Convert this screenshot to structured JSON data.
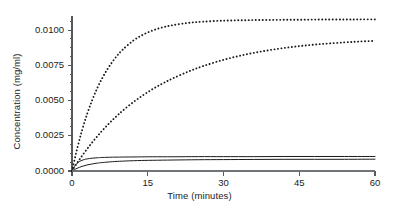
{
  "chart_data": {
    "type": "line",
    "title": "",
    "xlabel": "Time (minutes)",
    "ylabel": "Concentration (mg/ml)",
    "xlim": [
      0,
      60
    ],
    "ylim": [
      0,
      0.011
    ],
    "xticks": [
      0,
      15,
      30,
      45,
      60
    ],
    "xtick_labels": [
      "0",
      "15",
      "30",
      "45",
      "60"
    ],
    "yticks": [
      0.0,
      0.0025,
      0.005,
      0.0075,
      0.01
    ],
    "ytick_labels": [
      "0.0000",
      "0.0025",
      "0.0050",
      "0.0075",
      "0.0100"
    ],
    "y_minor_ticks": [
      0.000625,
      0.00125,
      0.001875,
      0.003125,
      0.00375,
      0.004375,
      0.005625,
      0.00625,
      0.006875,
      0.008125,
      0.00875,
      0.009375,
      0.010625
    ],
    "grid": false,
    "legend": "none",
    "axes_color": "#55585c",
    "curve_color": "#1b1b1b",
    "series": [
      {
        "name": "dotted-fast",
        "style": "dotted",
        "color": "#1b1b1b",
        "x": [
          0,
          1,
          2,
          3,
          4,
          5,
          6,
          7,
          8,
          9,
          10,
          12,
          14,
          16,
          18,
          20,
          23,
          26,
          30,
          34,
          38,
          42,
          46,
          50,
          54,
          57,
          60
        ],
        "values": [
          0.0,
          0.00155,
          0.0029,
          0.00405,
          0.00503,
          0.00588,
          0.0066,
          0.00722,
          0.00775,
          0.00821,
          0.0086,
          0.00922,
          0.00966,
          0.00998,
          0.0102,
          0.01035,
          0.01051,
          0.0106,
          0.01067,
          0.0107,
          0.01072,
          0.01073,
          0.01074,
          0.01075,
          0.01075,
          0.01076,
          0.01076
        ]
      },
      {
        "name": "dotted-slow",
        "style": "dotted",
        "color": "#1b1b1b",
        "x": [
          0,
          1,
          2,
          3,
          4,
          5,
          6,
          7,
          8,
          9,
          10,
          12,
          14,
          16,
          18,
          20,
          23,
          26,
          30,
          34,
          38,
          42,
          46,
          50,
          54,
          57,
          60
        ],
        "values": [
          0.0,
          0.00056,
          0.00108,
          0.00157,
          0.00203,
          0.00246,
          0.00287,
          0.00325,
          0.00361,
          0.00395,
          0.00427,
          0.00485,
          0.00536,
          0.00582,
          0.00622,
          0.00658,
          0.00705,
          0.00745,
          0.00789,
          0.00824,
          0.00851,
          0.00873,
          0.0089,
          0.00903,
          0.00913,
          0.00919,
          0.00924
        ]
      },
      {
        "name": "solid-upper",
        "style": "solid",
        "color": "#1b1b1b",
        "x": [
          0,
          0.5,
          1,
          1.5,
          2,
          2.5,
          3,
          4,
          5,
          6,
          8,
          10,
          13,
          16,
          20,
          25,
          30,
          36,
          42,
          48,
          54,
          60
        ],
        "values": [
          0.0,
          0.00034,
          0.00055,
          0.00068,
          0.00076,
          0.00082,
          0.00086,
          0.00091,
          0.00094,
          0.00096,
          0.00098,
          0.00099,
          0.001,
          0.00101,
          0.00101,
          0.00102,
          0.00102,
          0.00102,
          0.00103,
          0.00103,
          0.00103,
          0.00103
        ]
      },
      {
        "name": "solid-lower",
        "style": "solid",
        "color": "#1b1b1b",
        "x": [
          0,
          0.5,
          1,
          2,
          3,
          4,
          5,
          6,
          8,
          10,
          13,
          16,
          20,
          25,
          30,
          36,
          42,
          48,
          54,
          60
        ],
        "values": [
          0.0,
          0.0001,
          0.00019,
          0.00033,
          0.00043,
          0.0005,
          0.00056,
          0.0006,
          0.00066,
          0.0007,
          0.00074,
          0.00076,
          0.00078,
          0.0008,
          0.00081,
          0.00082,
          0.00083,
          0.00083,
          0.00083,
          0.00084
        ]
      },
      {
        "name": "baseline-flat",
        "style": "solid",
        "color": "#7a7d80",
        "x": [
          0,
          60
        ],
        "values": [
          0.0,
          0.0
        ]
      }
    ]
  },
  "layout": {
    "plot_left": 72,
    "plot_right": 375,
    "plot_top": 16,
    "plot_bottom": 171
  }
}
